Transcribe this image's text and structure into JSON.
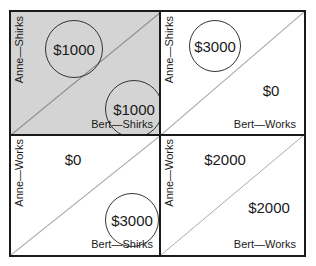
{
  "diagram": {
    "cells": [
      {
        "row_label": "Anne—Shirks",
        "col_label": "Bert—Shirks",
        "anne_payoff": "$1000",
        "bert_payoff": "$1000",
        "anne_circled": true,
        "bert_circled": true,
        "shaded": true,
        "fill": "#d4d4d4"
      },
      {
        "row_label": "Anne—Shirks",
        "col_label": "Bert—Works",
        "anne_payoff": "$3000",
        "bert_payoff": "$0",
        "anne_circled": true,
        "bert_circled": false,
        "shaded": false,
        "fill": "#ffffff"
      },
      {
        "row_label": "Anne—Works",
        "col_label": "Bert—Shirks",
        "anne_payoff": "$0",
        "bert_payoff": "$3000",
        "anne_circled": false,
        "bert_circled": true,
        "shaded": false,
        "fill": "#ffffff"
      },
      {
        "row_label": "Anne—Works",
        "col_label": "Bert—Works",
        "anne_payoff": "$2000",
        "bert_payoff": "$2000",
        "anne_circled": false,
        "bert_circled": false,
        "shaded": false,
        "fill": "#ffffff"
      }
    ],
    "colors": {
      "border": "#1a1a1a",
      "diagonal": "#9a9a9a",
      "shade": "#d4d4d4"
    }
  }
}
